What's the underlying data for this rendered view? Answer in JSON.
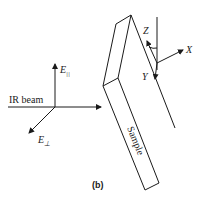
{
  "diagram": {
    "labels": {
      "e_parallel": "E",
      "e_parallel_sub": "||",
      "e_perp": "E",
      "e_perp_sub": "⊥",
      "ir_beam": "IR beam",
      "sample": "Sample",
      "axis_x": "X",
      "axis_y": "Y",
      "axis_z": "Z",
      "caption": "(b)"
    },
    "colors": {
      "ink": "#1a1a1a",
      "background": "#ffffff"
    }
  }
}
